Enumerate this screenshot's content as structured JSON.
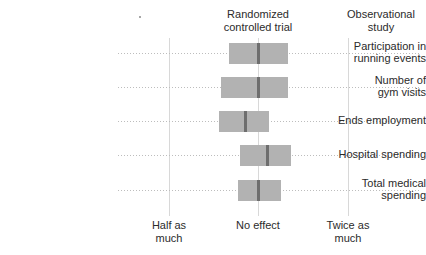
{
  "chart_data": {
    "type": "bar",
    "subtype": "horizontal-range-bars-with-median",
    "title": "",
    "xlabel": "",
    "ylabel": "",
    "grid": true,
    "legend_position": "top",
    "axis": {
      "scale": "log2-effect-ratio",
      "ticks": [
        {
          "label": "Half as\nmuch",
          "value": 0.5,
          "x_px": 169
        },
        {
          "label": "No effect",
          "value": 1.0,
          "x_px": 258
        },
        {
          "label": "Twice as\nmuch",
          "value": 2.0,
          "x_px": 348
        }
      ],
      "xlim": [
        0.42,
        2.4
      ]
    },
    "column_headers": [
      {
        "name": "rct",
        "label": "Randomized\ncontrolled trial",
        "x_px": 258
      },
      {
        "name": "observational",
        "label": "Observational\nstudy",
        "x_px": 381
      }
    ],
    "categories": [
      "Participation in\nrunning events",
      "Number of\ngym visits",
      "Ends employment",
      "Hospital spending",
      "Total medical\nspending"
    ],
    "rows": [
      {
        "label": "Participation in\nrunning events",
        "y_px": 53,
        "range_low": 0.8,
        "range_high": 1.26,
        "median": 1.0,
        "bar_left_px": 229,
        "bar_right_px": 288,
        "median_px": 258
      },
      {
        "label": "Number of\ngym visits",
        "y_px": 87,
        "range_low": 0.74,
        "range_high": 1.26,
        "median": 1.0,
        "bar_left_px": 221,
        "bar_right_px": 288,
        "median_px": 258
      },
      {
        "label": "Ends employment",
        "y_px": 121,
        "range_low": 0.74,
        "range_high": 1.09,
        "median": 0.9,
        "bar_left_px": 219,
        "bar_right_px": 269,
        "median_px": 245
      },
      {
        "label": "Hospital spending",
        "y_px": 155,
        "range_low": 0.87,
        "range_high": 1.28,
        "median": 1.07,
        "bar_left_px": 240,
        "bar_right_px": 291,
        "median_px": 267
      },
      {
        "label": "Total medical\nspending",
        "y_px": 190,
        "range_low": 0.86,
        "range_high": 1.19,
        "median": 1.0,
        "bar_left_px": 238,
        "bar_right_px": 281,
        "median_px": 258
      }
    ],
    "colors": {
      "bar_fill": "#b2b2b2",
      "median_line": "#6e6e6e",
      "gridline_horizontal": "#bdbdbd",
      "gridline_vertical": "#d8d8d8",
      "text": "#2b2b2b",
      "background": "#ffffff"
    }
  }
}
